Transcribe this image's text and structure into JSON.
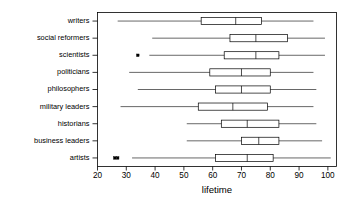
{
  "chart_data": {
    "type": "box",
    "title": "",
    "xlabel": "lifetime",
    "ylabel": "",
    "orientation": "horizontal",
    "xlim": [
      20,
      103
    ],
    "xticks": [
      20,
      30,
      40,
      50,
      60,
      70,
      80,
      90,
      100
    ],
    "xticklabels": [
      "20",
      "30",
      "40",
      "50",
      "60",
      "70",
      "80",
      "90",
      "100"
    ],
    "grid": false,
    "legend": "none",
    "categories": [
      "writers",
      "social reformers",
      "scientists",
      "politicians",
      "philosophers",
      "military leaders",
      "historians",
      "business leaders",
      "artists"
    ],
    "boxes": [
      {
        "category": "writers",
        "whisker_low": 27,
        "q1": 56,
        "median": 68,
        "q3": 77,
        "whisker_high": 95,
        "outliers": []
      },
      {
        "category": "social reformers",
        "whisker_low": 39,
        "q1": 66,
        "median": 75,
        "q3": 86,
        "whisker_high": 99,
        "outliers": []
      },
      {
        "category": "scientists",
        "whisker_low": 38,
        "q1": 64,
        "median": 75,
        "q3": 83,
        "whisker_high": 99,
        "outliers": [
          34
        ]
      },
      {
        "category": "politicians",
        "whisker_low": 31,
        "q1": 59,
        "median": 70,
        "q3": 80,
        "whisker_high": 95,
        "outliers": []
      },
      {
        "category": "philosophers",
        "whisker_low": 34,
        "q1": 61,
        "median": 70,
        "q3": 80,
        "whisker_high": 96,
        "outliers": []
      },
      {
        "category": "military leaders",
        "whisker_low": 28,
        "q1": 55,
        "median": 67,
        "q3": 79,
        "whisker_high": 95,
        "outliers": []
      },
      {
        "category": "historians",
        "whisker_low": 51,
        "q1": 63,
        "median": 72,
        "q3": 83,
        "whisker_high": 96,
        "outliers": []
      },
      {
        "category": "business leaders",
        "whisker_low": 51,
        "q1": 70,
        "median": 76,
        "q3": 83,
        "whisker_high": 98,
        "outliers": []
      },
      {
        "category": "artists",
        "whisker_low": 32,
        "q1": 61,
        "median": 72,
        "q3": 81,
        "whisker_high": 101,
        "outliers": [
          26,
          27
        ]
      }
    ],
    "colors": {
      "line": "#000000",
      "box_fill": "none",
      "background": "#ffffff"
    }
  }
}
